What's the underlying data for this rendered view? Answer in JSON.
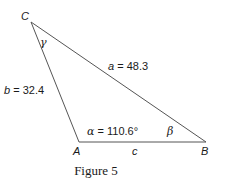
{
  "figure": {
    "caption": "Figure 5",
    "vertices": {
      "A": {
        "label": "A",
        "x": 79,
        "y": 142
      },
      "B": {
        "label": "B",
        "x": 206,
        "y": 142
      },
      "C": {
        "label": "C",
        "x": 31,
        "y": 22
      }
    },
    "sides": {
      "a": {
        "label_var": "a",
        "label_value": " = 48.3"
      },
      "b": {
        "label_var": "b",
        "label_value": " = 32.4"
      },
      "c": {
        "label_var": "c"
      }
    },
    "angles": {
      "alpha": {
        "symbol": "α",
        "value": " = 110.6°"
      },
      "beta": {
        "symbol": "β"
      },
      "gamma": {
        "symbol": "γ"
      }
    },
    "colors": {
      "stroke": "#555555",
      "text": "#1a1a1a"
    }
  }
}
